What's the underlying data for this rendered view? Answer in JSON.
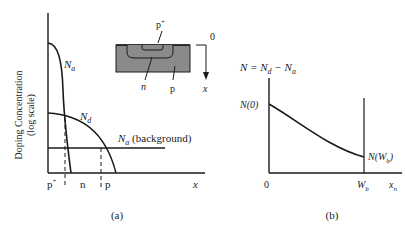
{
  "figure_a": {
    "ylabel_line1": "Doping Concentration",
    "ylabel_line2": "(log scale)",
    "curve_Na_label": "N",
    "curve_Na_sub": "a",
    "curve_Nd_label": "N",
    "curve_Nd_sub": "d",
    "background_label": "N",
    "background_sub": "a",
    "background_suffix": " (background)",
    "region_p_plus": "p",
    "region_p_plus_sup": "+",
    "region_n": "n",
    "region_p": "p",
    "xaxis_label": "x",
    "caption": "(a)",
    "inset": {
      "p_plus_label": "p",
      "p_plus_sup": "+",
      "n_label": "n",
      "p_label": "p",
      "depth_origin": "0",
      "depth_axis": "x"
    }
  },
  "figure_b": {
    "equation_N": "N = N",
    "equation_d": "d",
    "equation_minus": " − N",
    "equation_a": "a",
    "y_start_label": "N(0)",
    "y_end_label_pre": "N(W",
    "y_end_label_sub": "b",
    "y_end_label_post": ")",
    "origin_label": "0",
    "wb_label": "W",
    "wb_sub": "b",
    "xaxis_label": "x",
    "xaxis_sub": "n",
    "caption": "(b)"
  },
  "colors": {
    "line": "#1a1a1a",
    "substrate_fill": "#8a8a8a"
  }
}
